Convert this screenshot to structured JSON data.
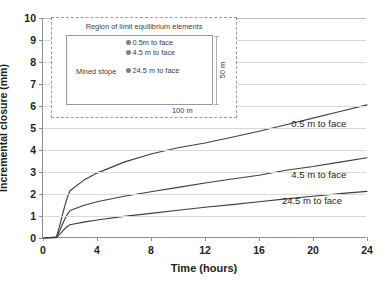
{
  "chart_data": {
    "type": "line",
    "title": "",
    "xlabel": "Time (hours)",
    "ylabel": "Incremental closure (mm)",
    "xlim": [
      0,
      24
    ],
    "ylim": [
      0,
      10
    ],
    "xticks": [
      0,
      4,
      8,
      12,
      16,
      20,
      24
    ],
    "yticks": [
      0,
      1,
      2,
      3,
      4,
      5,
      6,
      7,
      8,
      9,
      10
    ],
    "grid": "horizontal",
    "legend_position": "inline-right-of-curves",
    "x": [
      0,
      0.5,
      1,
      1.25,
      1.5,
      1.75,
      2,
      3,
      4,
      6,
      8,
      10,
      12,
      14,
      16,
      18,
      20,
      22,
      24
    ],
    "series": [
      {
        "name": "0.5 m to face",
        "label": "0.5 m to face",
        "color": "#3f3f3f",
        "values": [
          0,
          0.02,
          0.05,
          0.6,
          1.2,
          1.75,
          2.15,
          2.62,
          2.95,
          3.45,
          3.82,
          4.1,
          4.32,
          4.58,
          4.85,
          5.15,
          5.45,
          5.75,
          6.05
        ]
      },
      {
        "name": "4.5 m to face",
        "label": "4.5 m to face",
        "color": "#3f3f3f",
        "values": [
          0,
          0.01,
          0.03,
          0.35,
          0.7,
          1.02,
          1.25,
          1.48,
          1.65,
          1.9,
          2.1,
          2.3,
          2.5,
          2.68,
          2.85,
          3.08,
          3.25,
          3.45,
          3.65
        ]
      },
      {
        "name": "24.5 m to face",
        "label": "24.5 m to face",
        "color": "#3f3f3f",
        "values": [
          0,
          0.01,
          0.02,
          0.18,
          0.35,
          0.5,
          0.6,
          0.72,
          0.82,
          0.98,
          1.12,
          1.26,
          1.4,
          1.52,
          1.65,
          1.78,
          1.9,
          2.02,
          2.12
        ]
      }
    ],
    "annotations": [
      {
        "text": "0.5 m to face",
        "x": 20.5,
        "y": 5.25
      },
      {
        "text": "4.5 m to face",
        "x": 20.5,
        "y": 2.9
      },
      {
        "text": "24.5 m to face",
        "x": 20.0,
        "y": 1.75
      }
    ]
  },
  "inset": {
    "title": "Region of limit equilibrium elements",
    "stope_label": "Mined stope",
    "points": [
      {
        "label": "0.5m to face"
      },
      {
        "label": "4.5 m to face"
      },
      {
        "label": "24.5 m to face"
      }
    ],
    "dim_horizontal": "100 m",
    "dim_vertical": "50 m"
  },
  "axes": {
    "y_title": "Incremental closure (mm)",
    "x_title": "Time (hours)",
    "y_tick_labels": [
      "0",
      "1",
      "2",
      "3",
      "4",
      "5",
      "6",
      "7",
      "8",
      "9",
      "10"
    ],
    "x_tick_labels": [
      "0",
      "4",
      "8",
      "12",
      "16",
      "20",
      "24"
    ]
  }
}
